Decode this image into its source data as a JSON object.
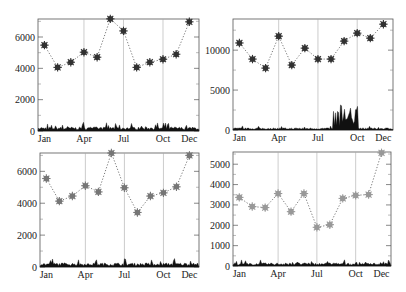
{
  "chart_data": [
    {
      "type": "line",
      "panel": "top-left",
      "title": "",
      "xlabel": "",
      "ylabel": "",
      "categories": [
        "Jan",
        "Feb",
        "Mar",
        "Apr",
        "May",
        "Jun",
        "Jul",
        "Aug",
        "Sep",
        "Oct",
        "Nov",
        "Dec"
      ],
      "x_tick_labels": [
        "Jan",
        "Apr",
        "Jul",
        "Oct",
        "Dec"
      ],
      "y_ticks": [
        0,
        2000,
        4000,
        6000
      ],
      "ylim": [
        0,
        7150
      ],
      "marker_color": "#333333",
      "series": [
        {
          "name": "monthly",
          "style": "dotted line with star markers",
          "values": [
            5480,
            4060,
            4390,
            5030,
            4710,
            7160,
            6390,
            4060,
            4390,
            4580,
            4900,
            6970
          ]
        },
        {
          "name": "daily",
          "style": "black filled spikes near baseline",
          "approx_range": [
            0,
            700
          ]
        }
      ],
      "grid": "vertical lines at Apr, Jul, Oct"
    },
    {
      "type": "line",
      "panel": "top-right",
      "categories": [
        "Jan",
        "Feb",
        "Mar",
        "Apr",
        "May",
        "Jun",
        "Jul",
        "Aug",
        "Sep",
        "Oct",
        "Nov",
        "Dec"
      ],
      "x_tick_labels": [
        "Jan",
        "Apr",
        "Jul",
        "Oct",
        "Dec"
      ],
      "y_ticks": [
        0,
        5000,
        10000
      ],
      "ylim": [
        0,
        13900
      ],
      "marker_color": "#333333",
      "series": [
        {
          "name": "monthly",
          "style": "dotted line with star markers",
          "values": [
            10900,
            8880,
            7750,
            11750,
            8130,
            10250,
            8880,
            8880,
            11130,
            12130,
            11500,
            13250
          ]
        },
        {
          "name": "daily",
          "style": "black filled spikes near baseline",
          "approx_range": [
            0,
            3200
          ],
          "peak_period": "Aug-Sep"
        }
      ],
      "grid": "vertical lines at Apr, Jul, Oct"
    },
    {
      "type": "line",
      "panel": "bottom-left",
      "categories": [
        "Jan",
        "Feb",
        "Mar",
        "Apr",
        "May",
        "Jun",
        "Jul",
        "Aug",
        "Sep",
        "Oct",
        "Nov",
        "Dec"
      ],
      "x_tick_labels": [
        "Jan",
        "Apr",
        "Jul",
        "Oct",
        "Dec"
      ],
      "y_ticks": [
        0,
        2000,
        4000,
        6000
      ],
      "ylim": [
        0,
        7150
      ],
      "marker_color": "#777777",
      "series": [
        {
          "name": "monthly",
          "style": "dotted line with star markers",
          "values": [
            5550,
            4130,
            4450,
            5100,
            4710,
            7150,
            4970,
            3420,
            4450,
            4650,
            5030,
            7000
          ]
        },
        {
          "name": "daily",
          "style": "black filled spikes near baseline",
          "approx_range": [
            0,
            700
          ]
        }
      ],
      "grid": "vertical lines at Apr, Jul, Oct"
    },
    {
      "type": "line",
      "panel": "bottom-right",
      "categories": [
        "Jan",
        "Feb",
        "Mar",
        "Apr",
        "May",
        "Jun",
        "Jul",
        "Aug",
        "Sep",
        "Oct",
        "Nov",
        "Dec"
      ],
      "x_tick_labels": [
        "Jan",
        "Apr",
        "Jul",
        "Oct",
        "Dec"
      ],
      "y_ticks": [
        0,
        1000,
        2000,
        3000,
        4000,
        5000
      ],
      "ylim": [
        0,
        5600
      ],
      "marker_color": "#999999",
      "series": [
        {
          "name": "monthly",
          "style": "dotted line with star markers",
          "values": [
            3370,
            2920,
            2870,
            3560,
            2670,
            3560,
            1900,
            2030,
            3320,
            3470,
            3510,
            5560
          ]
        },
        {
          "name": "daily",
          "style": "black filled spikes near baseline",
          "approx_range": [
            0,
            400
          ]
        }
      ],
      "grid": "vertical lines at Apr, Jul, Oct"
    }
  ]
}
